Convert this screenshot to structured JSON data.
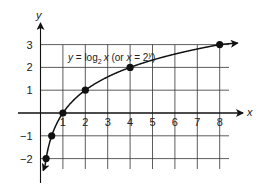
{
  "chart_data": {
    "type": "line",
    "title": "",
    "annotation": "y = log2 x (or x = 2^y)",
    "annotation_parts": {
      "y": "y",
      "eq": " = log",
      "sub": "2",
      "x": "x",
      "paren_open": " (or ",
      "x2": "x",
      "eq2": " = 2",
      "sup": "y",
      "paren_close": ")"
    },
    "xlabel": "x",
    "ylabel": "y",
    "xlim": [
      0,
      8
    ],
    "ylim": [
      -2,
      3
    ],
    "x_ticks": [
      "1",
      "2",
      "3",
      "4",
      "5",
      "6",
      "7",
      "8"
    ],
    "y_ticks": [
      "-2",
      "-1",
      "1",
      "2",
      "3"
    ],
    "grid": true,
    "series": [
      {
        "name": "y = log2 x",
        "x": [
          0.25,
          0.5,
          1,
          2,
          4,
          8
        ],
        "y": [
          -2,
          -1,
          0,
          1,
          2,
          3
        ],
        "markers": true,
        "color": "#111111"
      }
    ]
  }
}
